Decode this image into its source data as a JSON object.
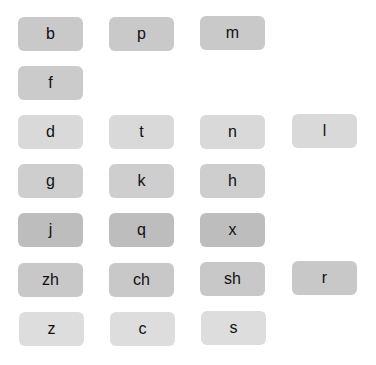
{
  "keyboard": {
    "rows": [
      {
        "keys": [
          "b",
          "p",
          "m"
        ]
      },
      {
        "keys": [
          "f"
        ]
      },
      {
        "keys": [
          "d",
          "t",
          "n",
          "l"
        ]
      },
      {
        "keys": [
          "g",
          "k",
          "h"
        ]
      },
      {
        "keys": [
          "j",
          "q",
          "x"
        ]
      },
      {
        "keys": [
          "zh",
          "ch",
          "sh",
          "r"
        ]
      },
      {
        "keys": [
          "z",
          "c",
          "s"
        ]
      }
    ]
  }
}
